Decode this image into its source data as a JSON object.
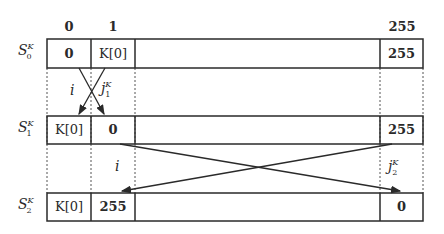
{
  "columns": {
    "c0": "0",
    "c1": "1",
    "c255": "255"
  },
  "rows": [
    {
      "label_base": "S",
      "label_sup": "K",
      "label_sub": "0",
      "cells": [
        "0",
        "K[0]",
        "255"
      ]
    },
    {
      "label_base": "S",
      "label_sup": "K",
      "label_sub": "1",
      "cells": [
        "K[0]",
        "0",
        "255"
      ]
    },
    {
      "label_base": "S",
      "label_sup": "K",
      "label_sub": "2",
      "cells": [
        "K[0]",
        "255",
        "0"
      ]
    }
  ],
  "annotations": {
    "i_first": "i",
    "j1_base": "j",
    "j1_sup": "K",
    "j1_sub": "1",
    "i_second": "i",
    "j2_base": "j",
    "j2_sup": "K",
    "j2_sub": "2"
  }
}
